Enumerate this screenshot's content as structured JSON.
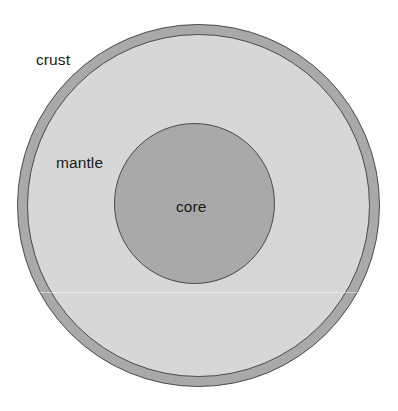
{
  "diagram": {
    "type": "concentric-cross-section",
    "background_color": "#ffffff",
    "outline_color": "#4a4a4a",
    "layers": [
      {
        "name": "crust",
        "label": "crust",
        "shape": "ring",
        "fill_color": "#a9a9a9",
        "center": {
          "x": 198,
          "y": 205
        },
        "outer_radius": 181,
        "inner_radius": 171,
        "label_position": {
          "x": 36,
          "y": 52
        }
      },
      {
        "name": "mantle",
        "label": "mantle",
        "shape": "ring",
        "fill_color": "#d7d7d7",
        "center": {
          "x": 198,
          "y": 205
        },
        "outer_radius": 171,
        "inner_radius": 80,
        "label_position": {
          "x": 56,
          "y": 155
        }
      },
      {
        "name": "core",
        "label": "core",
        "shape": "circle",
        "fill_color": "#a9a9a9",
        "center": {
          "x": 194,
          "y": 203
        },
        "outer_radius": 80,
        "label_position": {
          "x": 176,
          "y": 199
        }
      }
    ]
  }
}
